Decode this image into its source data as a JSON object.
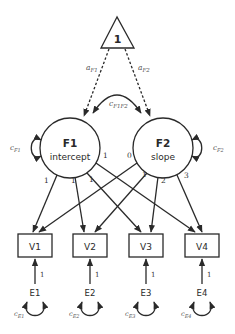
{
  "diagram": {
    "type": "latent growth curve model path diagram",
    "constant": {
      "label": "1"
    },
    "constant_paths": [
      {
        "label_main": "a",
        "label_sub": "F1",
        "target": "F1"
      },
      {
        "label_main": "a",
        "label_sub": "F2",
        "target": "F2"
      }
    ],
    "covariance": {
      "label_main": "c",
      "label_sub": "F1F2"
    },
    "factors": [
      {
        "id": "F1",
        "title": "F1",
        "subtitle": "intercept",
        "variance_main": "c",
        "variance_sub": "F1"
      },
      {
        "id": "F2",
        "title": "F2",
        "subtitle": "slope",
        "variance_main": "c",
        "variance_sub": "F2"
      }
    ],
    "loadings": {
      "F1": [
        "1",
        "1",
        "1",
        "1"
      ],
      "F2": [
        "0",
        "1",
        "2",
        "3"
      ]
    },
    "observed": [
      {
        "id": "V1",
        "label": "V1"
      },
      {
        "id": "V2",
        "label": "V2"
      },
      {
        "id": "V3",
        "label": "V3"
      },
      {
        "id": "V4",
        "label": "V4"
      }
    ],
    "errors": [
      {
        "id": "E1",
        "label": "E1",
        "path_label": "1",
        "variance_main": "c",
        "variance_sub": "E1"
      },
      {
        "id": "E2",
        "label": "E2",
        "path_label": "1",
        "variance_main": "c",
        "variance_sub": "E2"
      },
      {
        "id": "E3",
        "label": "E3",
        "path_label": "1",
        "variance_main": "c",
        "variance_sub": "E3"
      },
      {
        "id": "E4",
        "label": "E4",
        "path_label": "1",
        "variance_main": "c",
        "variance_sub": "E4"
      }
    ],
    "colors": {
      "line": "#2a2a2a",
      "background": "#ffffff",
      "param_text": "#555555"
    }
  }
}
